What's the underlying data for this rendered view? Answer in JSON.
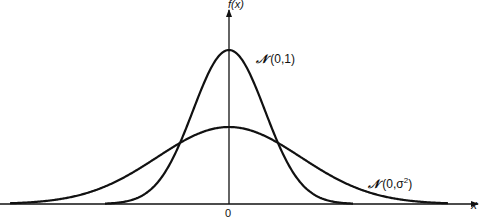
{
  "chart_data": {
    "type": "line",
    "title": "",
    "xlabel": "x",
    "ylabel": "f(x)",
    "x_ticks": [
      "0"
    ],
    "grid": false,
    "legend": "none (inline curve labels)",
    "series": [
      {
        "name": "N(0,1)",
        "label_prefix": "N",
        "label_args": "(0,1)",
        "mean": 0,
        "variance": 1,
        "peak_relative": 1.0,
        "color": "#111111"
      },
      {
        "name": "N(0,σ²)",
        "label_prefix": "N",
        "label_args_pre": "(0,σ",
        "label_sup": "2",
        "label_args_post": ")",
        "mean": 0,
        "variance_relative": 4,
        "peak_relative": 0.5,
        "color": "#111111"
      }
    ],
    "annotations": [
      "N (0,1)",
      "N (0,σ²)"
    ]
  },
  "labels": {
    "ylabel": "f(x)",
    "xlabel": "x",
    "origin": "0",
    "n1_prefix": "𝒩",
    "n1_args": " (0,1)",
    "n2_prefix": "𝒩",
    "n2_args": " (0,σ",
    "n2_sup": "2",
    "n2_close": ")"
  },
  "geometry": {
    "origin_x": 229,
    "baseline_y": 204,
    "narrow_peak_px": 154,
    "narrow_sigma_px": 36,
    "wide_peak_px": 77,
    "wide_sigma_px": 72
  }
}
